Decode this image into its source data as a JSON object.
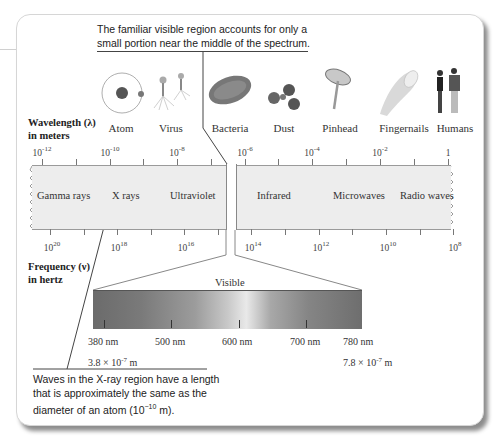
{
  "callouts": {
    "top": "The familiar visible region accounts for only a small portion near the middle of the spectrum.",
    "top_line1": "The familiar visible region accounts for only a",
    "top_line2": "small portion near the middle of the spectrum.",
    "bottom_line1": "Waves in the X-ray region have a length",
    "bottom_line2": "that is approximately the same as the",
    "bottom_line3_prefix": "diameter of an atom (10",
    "bottom_line3_exp": "−10",
    "bottom_line3_suffix": " m)."
  },
  "axes": {
    "wavelength_title_1": "Wavelength (λ)",
    "wavelength_title_2": "in meters",
    "frequency_title_1": "Frequency (ν)",
    "frequency_title_2": "in hertz"
  },
  "objects": [
    {
      "label": "Atom",
      "icon": "atom-icon"
    },
    {
      "label": "Virus",
      "icon": "virus-icon"
    },
    {
      "label": "Bacteria",
      "icon": "bacteria-icon"
    },
    {
      "label": "Dust",
      "icon": "dust-icon"
    },
    {
      "label": "Pinhead",
      "icon": "pinhead-icon"
    },
    {
      "label": "Fingernails",
      "icon": "fingernail-icon"
    },
    {
      "label": "Humans",
      "icon": "humans-icon"
    }
  ],
  "wavelength_ticks": [
    {
      "base": "10",
      "exp": "-12"
    },
    {
      "base": "10",
      "exp": "-10"
    },
    {
      "base": "10",
      "exp": "-8"
    },
    {
      "base": "10",
      "exp": "-6"
    },
    {
      "base": "10",
      "exp": "-4"
    },
    {
      "base": "10",
      "exp": "-2"
    },
    {
      "base": "1",
      "exp": ""
    }
  ],
  "frequency_ticks": [
    {
      "base": "10",
      "exp": "20"
    },
    {
      "base": "10",
      "exp": "18"
    },
    {
      "base": "10",
      "exp": "16"
    },
    {
      "base": "10",
      "exp": "14"
    },
    {
      "base": "10",
      "exp": "12"
    },
    {
      "base": "10",
      "exp": "10"
    },
    {
      "base": "10",
      "exp": "8"
    }
  ],
  "regions": [
    "Gamma rays",
    "X rays",
    "Ultraviolet",
    "Infrared",
    "Microwaves",
    "Radio waves"
  ],
  "visible": {
    "title": "Visible",
    "nm_labels": [
      "380 nm",
      "500 nm",
      "600 nm",
      "700 nm",
      "780 nm"
    ],
    "min_m": {
      "mantissa": "3.8 × 10",
      "exp": "-7",
      "unit": " m"
    },
    "max_m": {
      "mantissa": "7.8 × 10",
      "exp": "-7",
      "unit": " m"
    }
  },
  "colors": {
    "band": "#ededed",
    "line": "#444444",
    "card_border": "#d6d6d6"
  }
}
